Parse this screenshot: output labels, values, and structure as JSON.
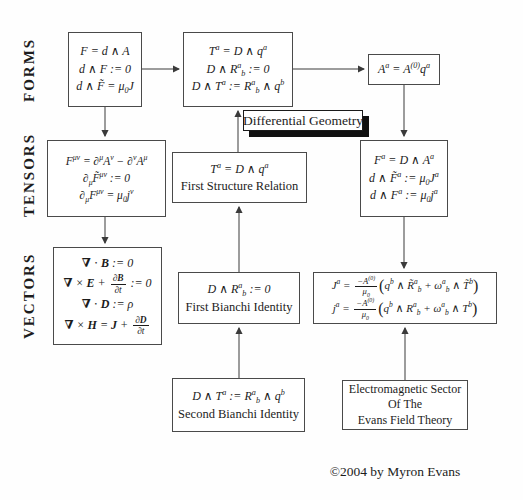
{
  "page": {
    "copyright": "©2004 by Myron Evans"
  },
  "labels": {
    "forms": "FORMS",
    "tensors": "TENSORS",
    "vectors": "VECTORS",
    "differential_geometry": "Differential Geometry"
  },
  "boxes": {
    "forms": {
      "lines": [
        "F = d ∧ A",
        "d ∧ F := 0",
        "d ∧ F̃ = μ<sub>0</sub>J"
      ]
    },
    "geometry": {
      "lines": [
        "T<sup>a</sup> = D ∧ q<sup>a</sup>",
        "D ∧ R<sup>a</sup><sub>b</sub> := 0",
        "D ∧ T<sup>a</sup> := R<sup>a</sup><sub>b</sub> ∧ q<sup>b</sup>"
      ]
    },
    "potential": {
      "lines": [
        "A<sup>a</sup> = A<sup>(0)</sup>q<sup>a</sup>"
      ]
    },
    "tensors": {
      "lines": [
        "F<sup>μν</sup> = ∂<sup>μ</sup>A<sup>ν</sup> − ∂<sup>ν</sup>A<sup>μ</sup>",
        "∂<sub>μ</sub>F̃<sup>μν</sup> := 0",
        "∂<sub>μ</sub>F<sup>μν</sup> = μ<sub>0</sub>j<sup>ν</sup>"
      ]
    },
    "first_structure": {
      "equation": "T<sup>a</sup> = D ∧ q<sup>a</sup>",
      "caption": "First Structure Relation"
    },
    "field": {
      "lines": [
        "F<sup>a</sup> = D ∧ A<sup>a</sup>",
        "d ∧ F̃<sup>a</sup> := μ<sub>0</sub>J<sup>a</sup>",
        "d ∧ F<sup>a</sup> := μ<sub>0</sub>j<sup>a</sup>"
      ]
    },
    "vectors": {
      "lines": [
        "<b>∇</b> ⋅ <b>B</b> := 0",
        "<b>∇</b> × <b>E</b> + <span class='frac'><span class='num'>∂<b>B</b></span><span class='den'>∂t</span></span> := 0",
        "<b>∇</b> ⋅ <b>D</b> := ρ",
        "<b>∇</b> × <b>H</b> = <b>J</b> + <span class='frac'><span class='num'>∂<b>D</b></span><span class='den'>∂t</span></span>"
      ]
    },
    "first_bianchi": {
      "equation": "D ∧ R<sup>a</sup><sub>b</sub> := 0",
      "caption": "First Bianchi Identity"
    },
    "current": {
      "lines": [
        "J<sup>a</sup> = <span class='frac'><span class='num'>−A<sup>(0)</sup></span><span class='den'>μ<sub>0</sub></span></span><span class='big'>(</span>q<sup>b</sup> ∧ R̃<sup>a</sup><sub>b</sub> + ω<sup>a</sup><sub>b</sub> ∧ T̃<sup>b</sup><span class='big'>)</span>",
        "j<sup>a</sup> = <span class='frac'><span class='num'>−A<sup>(0)</sup></span><span class='den'>μ<sub>0</sub></span></span><span class='big'>(</span>q<sup>b</sup> ∧ R<sup>a</sup><sub>b</sub> + ω<sup>a</sup><sub>b</sub> ∧ T<sup>b</sup><span class='big'>)</span>"
      ]
    },
    "second_bianchi": {
      "equation": "D ∧ T<sup>a</sup> := R<sup>a</sup><sub>b</sub> ∧ q<sup>b</sup>",
      "caption": "Second Bianchi Identity"
    },
    "em_sector": {
      "lines": [
        "Electromagnetic Sector",
        "Of The",
        "Evans Field Theory"
      ]
    }
  }
}
